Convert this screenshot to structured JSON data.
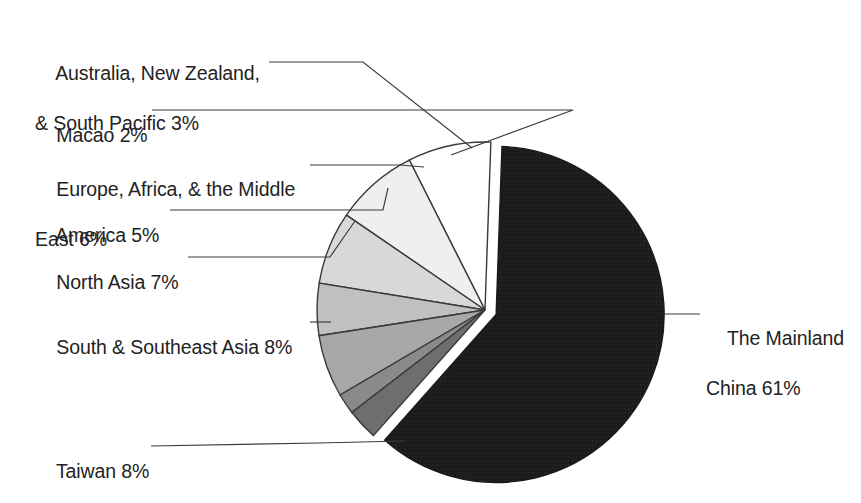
{
  "chart_data": {
    "type": "pie",
    "title": "",
    "subtitle": "",
    "xlabel": "",
    "ylabel": "",
    "legend_position": "callout-labels",
    "grid": false,
    "units": "percent",
    "exploded_slice": "The Mainland China",
    "start_angle_deg": -88,
    "direction": "clockwise",
    "categories": [
      "The Mainland China",
      "Taiwan",
      "South & Southeast Asia",
      "North Asia",
      "America",
      "Europe, Africa, & the Middle East",
      "Macao",
      "Australia, New Zealand, & South Pacific"
    ],
    "values": [
      61,
      8,
      8,
      7,
      5,
      6,
      2,
      3
    ],
    "slices": [
      {
        "label": "The Mainland China",
        "label_lines": [
          "The Mainland",
          "China 61%"
        ],
        "value": 61,
        "value_text": "61%",
        "color": "#1e1d1d",
        "exploded": true
      },
      {
        "label": "Taiwan",
        "label_lines": [
          "Taiwan 8%"
        ],
        "value": 8,
        "value_text": "8%",
        "color": "#ffffff",
        "exploded": false
      },
      {
        "label": "South & Southeast Asia",
        "label_lines": [
          "South & Southeast Asia 8%"
        ],
        "value": 8,
        "value_text": "8%",
        "color": "#efefef",
        "exploded": false
      },
      {
        "label": "North Asia",
        "label_lines": [
          "North Asia 7%"
        ],
        "value": 7,
        "value_text": "7%",
        "color": "#d8d8d8",
        "exploded": false
      },
      {
        "label": "America",
        "label_lines": [
          "America 5%"
        ],
        "value": 5,
        "value_text": "5%",
        "color": "#c0c0c0",
        "exploded": false
      },
      {
        "label": "Europe, Africa, & the Middle East",
        "label_lines": [
          "Europe, Africa, & the Middle",
          "East 6%"
        ],
        "value": 6,
        "value_text": "6%",
        "color": "#a8a8a8",
        "exploded": false
      },
      {
        "label": "Macao",
        "label_lines": [
          "Macao 2%"
        ],
        "value": 2,
        "value_text": "2%",
        "color": "#8a8a8a",
        "exploded": false
      },
      {
        "label": "Australia, New Zealand, & South Pacific",
        "label_lines": [
          "Australia, New Zealand,",
          "& South Pacific 3%"
        ],
        "value": 3,
        "value_text": "3%",
        "color": "#6e6e6e",
        "exploded": false
      }
    ]
  },
  "labels": {
    "australia": {
      "line1": "Australia, New Zealand,",
      "line2": "& South Pacific 3%"
    },
    "macao": {
      "line1": "Macao 2%"
    },
    "europe": {
      "line1": "Europe, Africa, & the Middle",
      "line2": "East 6%"
    },
    "america": {
      "line1": "America 5%"
    },
    "north_asia": {
      "line1": "North Asia 7%"
    },
    "south_southeast_asia": {
      "line1": "South & Southeast Asia 8%"
    },
    "taiwan": {
      "line1": "Taiwan 8%"
    },
    "mainland_china": {
      "line1": "The Mainland",
      "line2": "China 61%"
    }
  },
  "colors": {
    "background": "#ffffff",
    "text": "#232323",
    "stroke": "#3a3a3a",
    "mainland_china": "#1e1d1d",
    "taiwan": "#ffffff",
    "south_southeast_asia": "#efefef",
    "north_asia": "#d8d8d8",
    "america": "#c0c0c0",
    "europe": "#a8a8a8",
    "macao": "#8a8a8a",
    "australia": "#6e6e6e"
  }
}
